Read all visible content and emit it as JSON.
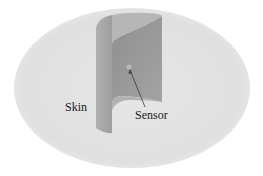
{
  "figure": {
    "labels": {
      "skin": "Skin",
      "sensor": "Sensor"
    },
    "colors": {
      "background": "#ffffff",
      "skin_surface": "#e2e2e2",
      "cylinder_outer": "#a9a9a9",
      "cylinder_top": "#b4b4b4",
      "cylinder_inner": "#9a9a9a",
      "arrow": "#3a3a3a",
      "text": "#1a1a1a"
    }
  }
}
